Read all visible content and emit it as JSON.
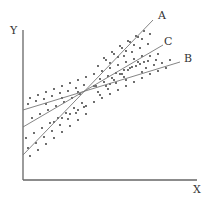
{
  "diagram": {
    "type": "scatter-with-regression-lines",
    "axes": {
      "x_label": "X",
      "y_label": "Y",
      "origin": [
        23,
        180
      ],
      "x_end": [
        197,
        180
      ],
      "y_end": [
        23,
        30
      ]
    },
    "lines": [
      {
        "id": "A",
        "label": "A",
        "from": [
          23,
          155
        ],
        "to": [
          153,
          20
        ],
        "label_pos": [
          158,
          19
        ]
      },
      {
        "id": "B",
        "label": "B",
        "from": [
          23,
          110
        ],
        "to": [
          180,
          62
        ],
        "label_pos": [
          184,
          62
        ]
      },
      {
        "id": "C",
        "label": "C",
        "from": [
          23,
          127
        ],
        "to": [
          163,
          45
        ],
        "label_pos": [
          164,
          45
        ]
      }
    ],
    "colors": {
      "axis": "#666666",
      "lines": "#777777",
      "dots": "#2a2a2a",
      "text": "#333333",
      "background": "#ffffff"
    },
    "scatter_points": [
      [
        30,
        98
      ],
      [
        38,
        95
      ],
      [
        46,
        92
      ],
      [
        54,
        89
      ],
      [
        62,
        86
      ],
      [
        70,
        83
      ],
      [
        78,
        80
      ],
      [
        86,
        77
      ],
      [
        94,
        74
      ],
      [
        102,
        71
      ],
      [
        110,
        68
      ],
      [
        118,
        65
      ],
      [
        126,
        62
      ],
      [
        134,
        59
      ],
      [
        142,
        56
      ],
      [
        28,
        104
      ],
      [
        36,
        101
      ],
      [
        44,
        99
      ],
      [
        52,
        96
      ],
      [
        60,
        93
      ],
      [
        68,
        91
      ],
      [
        76,
        88
      ],
      [
        84,
        85
      ],
      [
        100,
        79
      ],
      [
        108,
        76
      ],
      [
        116,
        73
      ],
      [
        124,
        70
      ],
      [
        132,
        67
      ],
      [
        140,
        64
      ],
      [
        148,
        61
      ],
      [
        32,
        118
      ],
      [
        40,
        114
      ],
      [
        48,
        110
      ],
      [
        56,
        106
      ],
      [
        64,
        102
      ],
      [
        72,
        98
      ],
      [
        80,
        94
      ],
      [
        96,
        86
      ],
      [
        104,
        82
      ],
      [
        112,
        78
      ],
      [
        120,
        74
      ],
      [
        128,
        70
      ],
      [
        136,
        66
      ],
      [
        144,
        62
      ],
      [
        26,
        138
      ],
      [
        34,
        133
      ],
      [
        42,
        128
      ],
      [
        50,
        123
      ],
      [
        58,
        118
      ],
      [
        66,
        113
      ],
      [
        74,
        108
      ],
      [
        82,
        103
      ],
      [
        98,
        92
      ],
      [
        106,
        86
      ],
      [
        114,
        80
      ],
      [
        122,
        74
      ],
      [
        130,
        68
      ],
      [
        138,
        62
      ],
      [
        28,
        148
      ],
      [
        36,
        143
      ],
      [
        44,
        137
      ],
      [
        52,
        131
      ],
      [
        60,
        125
      ],
      [
        68,
        119
      ],
      [
        76,
        113
      ],
      [
        84,
        107
      ],
      [
        100,
        95
      ],
      [
        108,
        89
      ],
      [
        116,
        83
      ],
      [
        124,
        77
      ],
      [
        30,
        156
      ],
      [
        38,
        150
      ],
      [
        46,
        144
      ],
      [
        54,
        138
      ],
      [
        62,
        132
      ],
      [
        70,
        126
      ],
      [
        78,
        120
      ],
      [
        86,
        114
      ],
      [
        104,
        58
      ],
      [
        112,
        52
      ],
      [
        120,
        46
      ],
      [
        128,
        41
      ],
      [
        136,
        36
      ],
      [
        144,
        31
      ],
      [
        110,
        63
      ],
      [
        118,
        57
      ],
      [
        126,
        51
      ],
      [
        134,
        45
      ],
      [
        142,
        39
      ],
      [
        150,
        34
      ],
      [
        98,
        66
      ],
      [
        106,
        60
      ],
      [
        114,
        54
      ],
      [
        122,
        48
      ],
      [
        130,
        42
      ],
      [
        138,
        37
      ],
      [
        146,
        68
      ],
      [
        154,
        65
      ],
      [
        162,
        63
      ],
      [
        170,
        60
      ],
      [
        150,
        74
      ],
      [
        158,
        71
      ],
      [
        166,
        68
      ],
      [
        142,
        78
      ],
      [
        134,
        82
      ],
      [
        126,
        86
      ],
      [
        118,
        90
      ],
      [
        110,
        94
      ],
      [
        102,
        98
      ],
      [
        94,
        102
      ],
      [
        86,
        106
      ],
      [
        78,
        110
      ],
      [
        70,
        114
      ],
      [
        62,
        118
      ],
      [
        54,
        122
      ],
      [
        150,
        56
      ],
      [
        158,
        54
      ],
      [
        140,
        48
      ],
      [
        148,
        44
      ],
      [
        132,
        52
      ],
      [
        124,
        56
      ],
      [
        46,
        104
      ],
      [
        62,
        98
      ],
      [
        78,
        92
      ],
      [
        94,
        86
      ],
      [
        110,
        84
      ],
      [
        126,
        80
      ],
      [
        142,
        72
      ],
      [
        156,
        60
      ]
    ]
  }
}
